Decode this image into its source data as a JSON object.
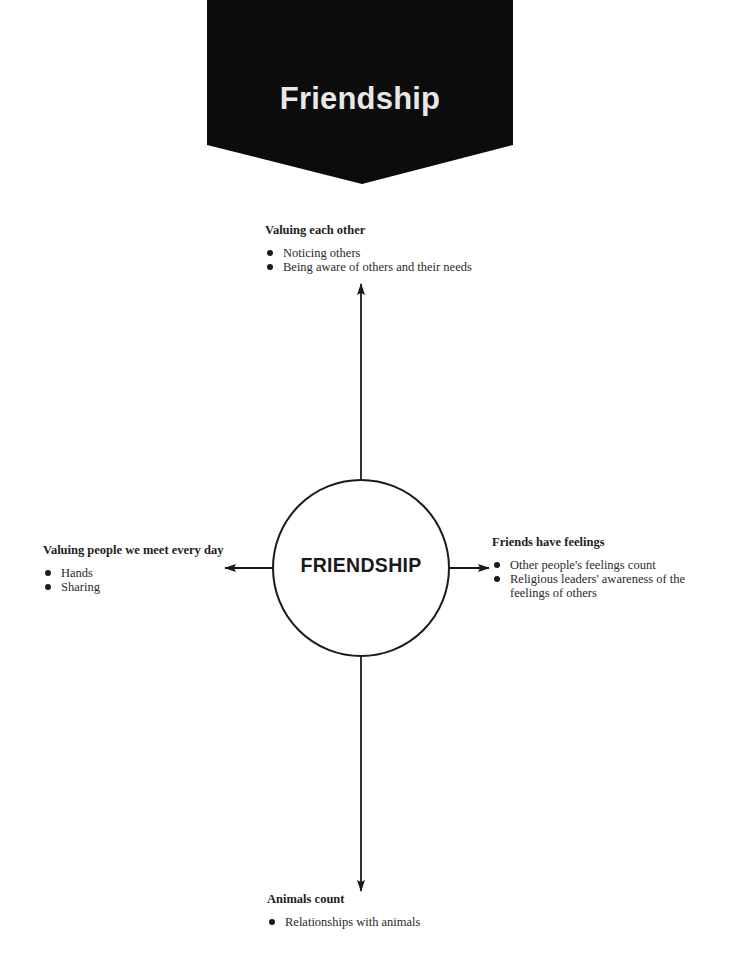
{
  "banner": {
    "title": "Friendship",
    "fill_color": "#0c0c0c",
    "text_color": "#e8e8e8"
  },
  "center": {
    "label": "FRIENDSHIP"
  },
  "nodes": {
    "top": {
      "heading": "Valuing each other",
      "items": [
        "Noticing others",
        "Being aware of others and their needs"
      ]
    },
    "left": {
      "heading": "Valuing people we meet every day",
      "items": [
        "Hands",
        "Sharing"
      ]
    },
    "right": {
      "heading": "Friends have feelings",
      "items": [
        "Other people's feelings count",
        "Religious leaders' awareness of the feelings of others"
      ]
    },
    "bottom": {
      "heading": "Animals count",
      "items": [
        "Relationships with animals"
      ]
    }
  }
}
